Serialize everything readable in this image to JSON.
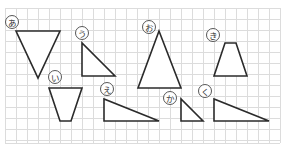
{
  "grid": {
    "x0": 5,
    "y0": 8,
    "cell": 11,
    "cols": 25,
    "rows": 12.3,
    "line_color": "#dcdcdc"
  },
  "shapes": [
    {
      "id": "a",
      "label": "あ",
      "type": "triangle",
      "points": [
        [
          16,
          31
        ],
        [
          60,
          31
        ],
        [
          38,
          78
        ]
      ],
      "label_pos": [
        12,
        22
      ]
    },
    {
      "id": "i",
      "label": "い",
      "type": "trapezoid",
      "points": [
        [
          49,
          88
        ],
        [
          82,
          88
        ],
        [
          71,
          121
        ],
        [
          60,
          121
        ]
      ],
      "label_pos": [
        55,
        77
      ]
    },
    {
      "id": "u",
      "label": "う",
      "type": "right-triangle",
      "points": [
        [
          82,
          43
        ],
        [
          82,
          76
        ],
        [
          115,
          76
        ]
      ],
      "label_pos": [
        82,
        33
      ]
    },
    {
      "id": "e",
      "label": "え",
      "type": "right-triangle",
      "points": [
        [
          104,
          99
        ],
        [
          104,
          121
        ],
        [
          159,
          121
        ]
      ],
      "label_pos": [
        107,
        89
      ]
    },
    {
      "id": "o",
      "label": "お",
      "type": "triangle",
      "points": [
        [
          159,
          31
        ],
        [
          138,
          88
        ],
        [
          181,
          88
        ]
      ],
      "label_pos": [
        149,
        27
      ]
    },
    {
      "id": "ka",
      "label": "か",
      "type": "right-triangle",
      "points": [
        [
          181,
          99
        ],
        [
          181,
          121
        ],
        [
          203,
          121
        ]
      ],
      "label_pos": [
        170,
        98
      ]
    },
    {
      "id": "ki",
      "label": "き",
      "type": "trapezoid",
      "points": [
        [
          225,
          43
        ],
        [
          236,
          43
        ],
        [
          247,
          76
        ],
        [
          214,
          76
        ]
      ],
      "label_pos": [
        213,
        35
      ]
    },
    {
      "id": "ku",
      "label": "く",
      "type": "right-triangle",
      "points": [
        [
          214,
          99
        ],
        [
          214,
          121
        ],
        [
          269,
          121
        ]
      ],
      "label_pos": [
        205,
        91
      ]
    }
  ]
}
